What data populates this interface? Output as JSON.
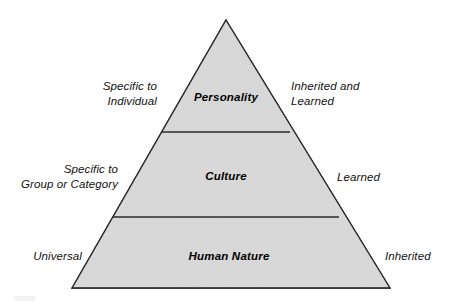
{
  "diagram": {
    "shape": "pyramid",
    "background_color": "#ffffff",
    "fill_color": "#d9d9d9",
    "stroke_color": "#2b2b2b",
    "geometry": {
      "apex": [
        226,
        20
      ],
      "base_left": [
        72,
        288
      ],
      "base_right": [
        390,
        288
      ],
      "divider_y": [
        132,
        217
      ]
    },
    "levels": [
      {
        "id": "personality",
        "label": "Personality",
        "left_annotation": "Specific to\nIndividual",
        "left_annotation_lines": [
          "Specific to",
          "Individual"
        ],
        "right_annotation": "Inherited and\nLearned",
        "right_annotation_lines": [
          "Inherited and",
          "Learned"
        ]
      },
      {
        "id": "culture",
        "label": "Culture",
        "left_annotation": "Specific to\nGroup or Category",
        "left_annotation_lines": [
          "Specific to",
          "Group or Category"
        ],
        "right_annotation": "Learned",
        "right_annotation_lines": [
          "Learned"
        ]
      },
      {
        "id": "human-nature",
        "label": "Human Nature",
        "left_annotation": "Universal",
        "left_annotation_lines": [
          "Universal"
        ],
        "right_annotation": "Inherited",
        "right_annotation_lines": [
          "Inherited"
        ]
      }
    ]
  }
}
